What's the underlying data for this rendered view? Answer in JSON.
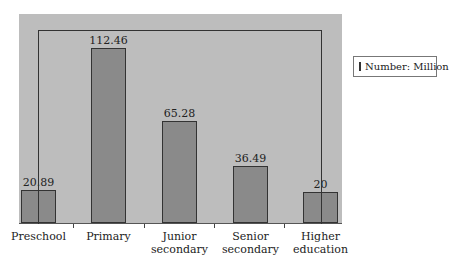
{
  "chart_data": {
    "type": "bar",
    "title": "",
    "xlabel": "",
    "ylabel": "",
    "categories": [
      "Preschool",
      "Primary",
      "Junior secondary",
      "Senior secondary",
      "Higher education"
    ],
    "category_lines": [
      [
        "Preschool"
      ],
      [
        "Primary"
      ],
      [
        "Junior",
        "secondary"
      ],
      [
        "Senior",
        "secondary"
      ],
      [
        "Higher",
        "education"
      ]
    ],
    "series": [
      {
        "name": "Number: Million",
        "values": [
          20.89,
          112.46,
          65.28,
          36.49,
          20
        ]
      }
    ],
    "value_labels": [
      "20.89",
      "112.46",
      "65.28",
      "36.49",
      "20"
    ],
    "ylim": [
      0,
      125
    ],
    "grid": false,
    "legend_position": "right",
    "annotations": [
      "Bracket line connecting Preschool and Higher education bars over the top of the chart"
    ]
  },
  "legend": {
    "label": "Number: Million"
  },
  "colors": {
    "plot_bg": "#bdbdbd",
    "bar_fill": "#8a8a8a",
    "bar_border": "#333333"
  }
}
